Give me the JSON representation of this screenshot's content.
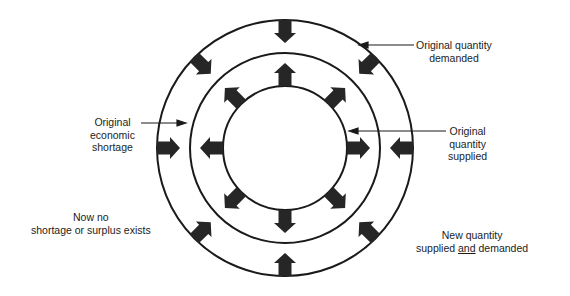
{
  "diagram": {
    "title": "",
    "center": [
      285,
      148
    ],
    "circles": {
      "outer": {
        "name": "original-quantity-demanded-circle",
        "radius": 128
      },
      "middle": {
        "name": "new-equilibrium-circle",
        "radius": 95
      },
      "inner": {
        "name": "original-quantity-supplied-circle",
        "radius": 62
      }
    },
    "arrow_angles_deg": [
      0,
      45,
      90,
      135,
      180,
      225,
      270,
      315
    ],
    "arrow_color": "#262626",
    "line_color": "#1a1a1a",
    "labels": {
      "demanded": {
        "line1": "Original quantity",
        "line2": "demanded"
      },
      "shortage": {
        "line1": "Original",
        "line2": "economic",
        "line3": "shortage"
      },
      "supplied": {
        "line1": "Original",
        "line2": "quantity",
        "line3": "supplied"
      },
      "no_shortage": {
        "line1": "Now no",
        "line2": "shortage or surplus exists"
      },
      "new_quantity": {
        "line1": "New quantity",
        "line2_a": "supplied ",
        "line2_b": "and",
        "line2_c": " demanded"
      }
    }
  }
}
